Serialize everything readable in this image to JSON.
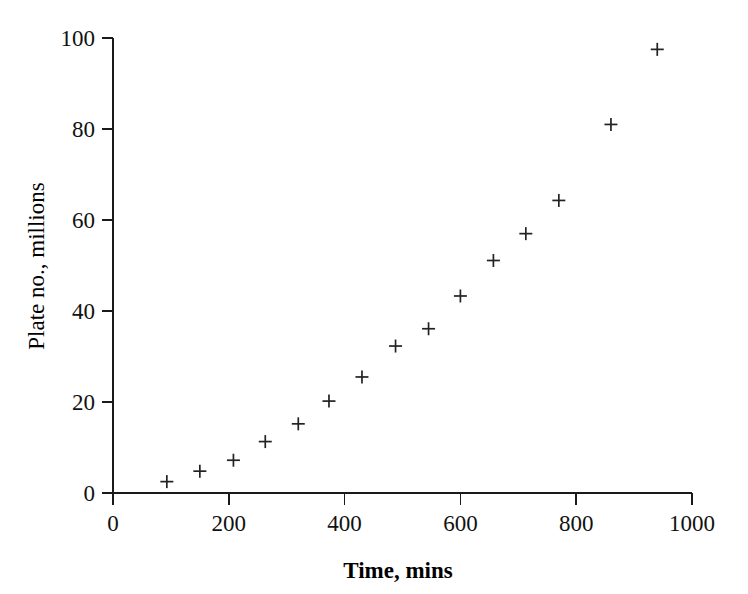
{
  "chart_data": {
    "type": "scatter",
    "title": "",
    "xlabel": "Time, mins",
    "ylabel": "Plate no., millions",
    "xlim": [
      0,
      1000
    ],
    "ylim": [
      0,
      100
    ],
    "grid": false,
    "legend": null,
    "marker": "plus",
    "marker_color": "#222222",
    "xticks": [
      0,
      200,
      400,
      600,
      800,
      1000
    ],
    "xtick_labels": [
      "0",
      "200",
      "400",
      "600",
      "800",
      "1000"
    ],
    "yticks": [
      0,
      20,
      40,
      60,
      80,
      100
    ],
    "ytick_labels": [
      "0",
      "20",
      "40",
      "60",
      "80",
      "100"
    ],
    "series": [
      {
        "name": "plate number",
        "x": [
          93,
          150,
          208,
          263,
          320,
          373,
          430,
          488,
          545,
          600,
          657,
          713,
          770,
          860,
          940
        ],
        "y": [
          2.5,
          4.8,
          7.2,
          11.3,
          15.2,
          20.2,
          25.5,
          32.3,
          36.1,
          43.3,
          51.1,
          57.0,
          64.3,
          81.0,
          97.5
        ]
      }
    ],
    "points": [
      {
        "x": 93,
        "y": 2.5
      },
      {
        "x": 150,
        "y": 4.8
      },
      {
        "x": 208,
        "y": 7.2
      },
      {
        "x": 263,
        "y": 11.3
      },
      {
        "x": 320,
        "y": 15.2
      },
      {
        "x": 373,
        "y": 20.2
      },
      {
        "x": 430,
        "y": 25.5
      },
      {
        "x": 488,
        "y": 32.3
      },
      {
        "x": 545,
        "y": 36.1
      },
      {
        "x": 600,
        "y": 43.3
      },
      {
        "x": 657,
        "y": 51.1
      },
      {
        "x": 713,
        "y": 57.0
      },
      {
        "x": 770,
        "y": 64.3
      },
      {
        "x": 860,
        "y": 81.0
      },
      {
        "x": 940,
        "y": 97.5
      }
    ]
  },
  "axes": {
    "x_title": "Time, mins",
    "y_title": "Plate no., millions"
  }
}
